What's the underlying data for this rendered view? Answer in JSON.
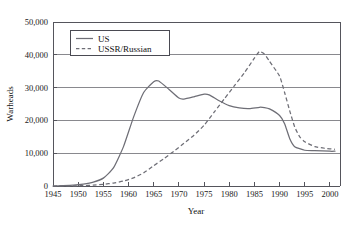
{
  "chart_data": {
    "type": "line",
    "title": "",
    "xlabel": "Year",
    "ylabel": "Warheads",
    "xlim": [
      1945,
      2002
    ],
    "ylim": [
      0,
      50000
    ],
    "grid": true,
    "legend_position": "top-left-inside",
    "xticks": [
      1945,
      1950,
      1955,
      1960,
      1965,
      1970,
      1975,
      1980,
      1985,
      1990,
      1995,
      2000
    ],
    "xticklabels": [
      "1945",
      "1950",
      "1955",
      "1960",
      "1965",
      "1970",
      "1975",
      "1980",
      "1985",
      "1990",
      "1995",
      "2000"
    ],
    "yticks": [
      0,
      10000,
      20000,
      30000,
      40000,
      50000
    ],
    "yticklabels": [
      "0",
      "10,000",
      "20,000",
      "30,000",
      "40,000",
      "50,000"
    ],
    "series": [
      {
        "name": "US",
        "style": "solid",
        "color": "#6e6e76",
        "x": [
          1945,
          1947,
          1949,
          1951,
          1953,
          1955,
          1957,
          1959,
          1961,
          1963,
          1965,
          1966,
          1968,
          1970,
          1971,
          1973,
          1975,
          1976,
          1978,
          1980,
          1982,
          1984,
          1986,
          1987,
          1988,
          1990,
          1991,
          1992,
          1993,
          1995,
          1997,
          2000,
          2001
        ],
        "y": [
          0,
          100,
          250,
          600,
          1200,
          2400,
          5500,
          12000,
          21000,
          28500,
          31800,
          32000,
          29500,
          26800,
          26500,
          27200,
          28000,
          27800,
          26000,
          24500,
          23800,
          23600,
          24000,
          23900,
          23500,
          21500,
          19000,
          14500,
          12000,
          10900,
          10800,
          10600,
          10600
        ]
      },
      {
        "name": "USSR/Russian",
        "style": "dashed",
        "color": "#6e6e76",
        "x": [
          1945,
          1949,
          1951,
          1953,
          1955,
          1957,
          1959,
          1961,
          1963,
          1965,
          1967,
          1969,
          1971,
          1973,
          1975,
          1977,
          1979,
          1981,
          1983,
          1985,
          1986,
          1987,
          1988,
          1990,
          1991,
          1992,
          1993,
          1994,
          1995,
          1997,
          1999,
          2001
        ],
        "y": [
          0,
          50,
          120,
          250,
          500,
          900,
          1500,
          2500,
          4000,
          6200,
          8300,
          10600,
          13000,
          15500,
          18500,
          22500,
          26500,
          30500,
          34500,
          39000,
          41000,
          40200,
          38000,
          33500,
          28500,
          23000,
          18000,
          15000,
          13500,
          12000,
          11500,
          11200
        ]
      }
    ]
  },
  "legend": {
    "items": [
      {
        "label": "US",
        "style": "solid"
      },
      {
        "label": "USSR/Russian",
        "style": "dashed"
      }
    ]
  }
}
